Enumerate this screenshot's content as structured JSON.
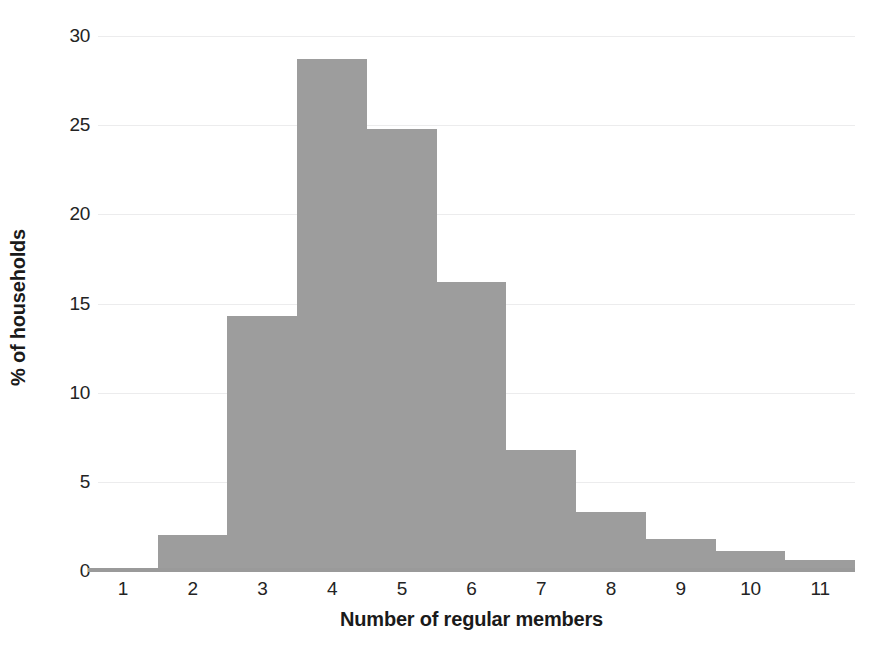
{
  "chart_data": {
    "type": "bar",
    "title": "",
    "subtitle": "",
    "xlabel": "Number of regular members",
    "ylabel": "% of households",
    "categories": [
      "1",
      "2",
      "3",
      "4",
      "5",
      "6",
      "7",
      "8",
      "9",
      "10",
      "11"
    ],
    "values": [
      0.1,
      2.0,
      14.3,
      28.7,
      24.8,
      16.2,
      6.8,
      3.3,
      1.8,
      1.1,
      0.6
    ],
    "series": [
      {
        "name": "% of households",
        "values": [
          0.1,
          2.0,
          14.3,
          28.7,
          24.8,
          16.2,
          6.8,
          3.3,
          1.8,
          1.1,
          0.6
        ]
      }
    ],
    "ylim": [
      0,
      30
    ],
    "xlim_categories": [
      "1",
      "11"
    ],
    "y_ticks": [
      0,
      5,
      10,
      15,
      20,
      25,
      30
    ],
    "y_tick_labels": [
      "0",
      "5",
      "10",
      "15",
      "20",
      "25",
      "30"
    ],
    "x_tick_labels": [
      "1",
      "2",
      "3",
      "4",
      "5",
      "6",
      "7",
      "8",
      "9",
      "10",
      "11"
    ],
    "grid": "horizontal",
    "legend": "none",
    "bar_gap": 0,
    "colors": {
      "bar_fill": "#9d9d9d",
      "gridline": "#ececed",
      "axis_line": "#9a9a9a",
      "text": "#1a1a1a",
      "background": "#ffffff"
    },
    "annotations": []
  }
}
